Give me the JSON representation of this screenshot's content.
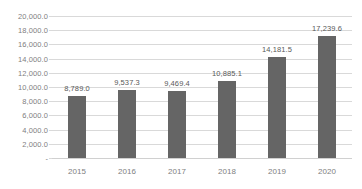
{
  "chart_data": {
    "type": "bar",
    "title": "",
    "subtitle": "",
    "xlabel": "",
    "ylabel": "",
    "categories": [
      "2015",
      "2016",
      "2017",
      "2018",
      "2019",
      "2020"
    ],
    "values": [
      8789.0,
      9537.3,
      9469.4,
      10885.1,
      14181.5,
      17239.6
    ],
    "data_labels": [
      "8,789.0",
      "9,537.3",
      "9,469.4",
      "10,885.1",
      "14,181.5",
      "17,239.6"
    ],
    "ylim": [
      0,
      20000
    ],
    "ytick_values": [
      0,
      2000,
      4000,
      6000,
      8000,
      10000,
      12000,
      14000,
      16000,
      18000,
      20000
    ],
    "ytick_labels": [
      "-",
      "2,000.0",
      "4,000.0",
      "6,000.0",
      "8,000.0",
      "10,000.0",
      "12,000.0",
      "14,000.0",
      "16,000.0",
      "18,000.0",
      "20,000.0"
    ],
    "grid": true,
    "legend": false,
    "legend_position": "none",
    "series": [
      {
        "name": "",
        "values": [
          8789.0,
          9537.3,
          9469.4,
          10885.1,
          14181.5,
          17239.6
        ]
      }
    ],
    "colors": {
      "bar": "#656565",
      "gridline": "#d9d9d9",
      "axis_text": "#808080",
      "data_label_text": "#595959",
      "background": "#ffffff"
    }
  }
}
